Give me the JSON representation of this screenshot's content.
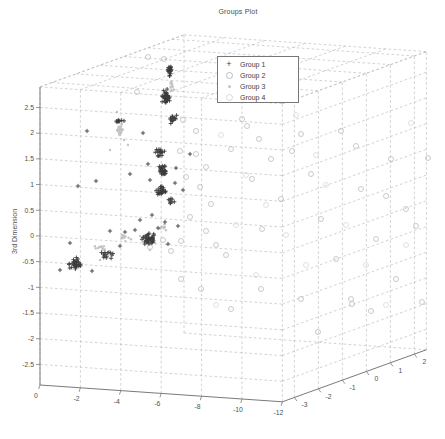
{
  "chart_data": {
    "type": "scatter",
    "projection": "3d",
    "title": "Groups Plot",
    "xlabel": "",
    "ylabel": "",
    "zlabel": "3rd Dimension",
    "x_ticks": [
      0,
      -2,
      -4,
      -6,
      -8,
      -10,
      -12
    ],
    "y_ticks": [
      -3,
      -2,
      -1,
      0,
      1,
      2
    ],
    "z_ticks": [
      2.5,
      2,
      1.5,
      1,
      0.5,
      0,
      -0.5,
      -1,
      -1.5,
      -2,
      -2.5
    ],
    "x_range": [
      -12,
      0
    ],
    "y_range": [
      -3.5,
      2.5
    ],
    "z_range": [
      -2.9,
      2.9
    ],
    "grid": true,
    "legend_position": "top-center",
    "colors": {
      "grid": "#b3b3b3",
      "axis": "#7a7a7a",
      "tick_label": "#4f4f4f",
      "title": "#4a4a4a",
      "legend_border": "#777777",
      "background": "#ffffff"
    },
    "groups": [
      {
        "name": "Group 1",
        "marker": "plus",
        "color": "#3c3c3c",
        "px_clusters": [
          {
            "cx": 170,
            "cy": 70,
            "rx": 4,
            "ry": 7,
            "n": 22
          },
          {
            "cx": 166,
            "cy": 97,
            "rx": 6,
            "ry": 9,
            "n": 40
          },
          {
            "cx": 173,
            "cy": 118,
            "rx": 6,
            "ry": 7,
            "n": 14
          },
          {
            "cx": 119,
            "cy": 121,
            "rx": 7,
            "ry": 2,
            "n": 10
          },
          {
            "cx": 159,
            "cy": 153,
            "rx": 6,
            "ry": 7,
            "n": 18
          },
          {
            "cx": 163,
            "cy": 171,
            "rx": 6,
            "ry": 8,
            "n": 30
          },
          {
            "cx": 161,
            "cy": 191,
            "rx": 7,
            "ry": 7,
            "n": 26
          },
          {
            "cx": 170,
            "cy": 201,
            "rx": 6,
            "ry": 4,
            "n": 8
          },
          {
            "cx": 148,
            "cy": 239,
            "rx": 11,
            "ry": 8,
            "n": 40
          },
          {
            "cx": 76,
            "cy": 263,
            "rx": 8,
            "ry": 8,
            "n": 32
          },
          {
            "cx": 108,
            "cy": 254,
            "rx": 11,
            "ry": 7,
            "n": 14
          }
        ],
        "px_points": [
          [
            96,
            181
          ],
          [
            78,
            186
          ],
          [
            130,
            174
          ],
          [
            87,
            131
          ],
          [
            143,
            133
          ],
          [
            190,
            154
          ],
          [
            152,
            215
          ],
          [
            140,
            220
          ],
          [
            178,
            226
          ],
          [
            70,
            243
          ],
          [
            60,
            270
          ],
          [
            92,
            271
          ],
          [
            120,
            246
          ],
          [
            135,
            230
          ],
          [
            165,
            222
          ],
          [
            176,
            168
          ],
          [
            150,
            180
          ],
          [
            148,
            164
          ],
          [
            175,
            183
          ],
          [
            183,
            190
          ],
          [
            125,
            232
          ],
          [
            110,
            231
          ],
          [
            158,
            228
          ],
          [
            168,
            244
          ]
        ]
      },
      {
        "name": "Group 2",
        "marker": "circle",
        "color": "#bdbdbd",
        "px_clusters": [],
        "px_points": [
          [
            148,
            57
          ],
          [
            164,
            59
          ],
          [
            137,
            92
          ],
          [
            183,
            120
          ],
          [
            196,
            131
          ],
          [
            247,
            126
          ],
          [
            259,
            139
          ],
          [
            292,
            151
          ],
          [
            180,
            151
          ],
          [
            196,
            154
          ],
          [
            206,
            167
          ],
          [
            186,
            177
          ],
          [
            200,
            187
          ],
          [
            211,
            204
          ],
          [
            190,
            217
          ],
          [
            206,
            231
          ],
          [
            216,
            245
          ],
          [
            226,
            255
          ],
          [
            181,
            241
          ],
          [
            171,
            251
          ],
          [
            231,
            149
          ],
          [
            242,
            119
          ],
          [
            252,
            179
          ],
          [
            262,
            229
          ],
          [
            271,
            159
          ],
          [
            281,
            199
          ],
          [
            301,
            134
          ],
          [
            311,
            174
          ],
          [
            321,
            219
          ],
          [
            336,
            259
          ],
          [
            351,
            299
          ],
          [
            361,
            189
          ],
          [
            376,
            239
          ],
          [
            391,
            159
          ],
          [
            406,
            209
          ],
          [
            301,
            299
          ],
          [
            261,
            289
          ],
          [
            231,
            309
          ],
          [
            201,
            289
          ],
          [
            181,
            279
          ],
          [
            341,
            131
          ],
          [
            371,
            311
          ],
          [
            396,
            279
          ],
          [
            416,
            226
          ],
          [
            356,
            146
          ],
          [
            386,
            196
          ],
          [
            163,
            240
          ],
          [
            150,
            247
          ],
          [
            318,
            332
          ],
          [
            352,
            304
          ],
          [
            428,
            158
          ],
          [
            422,
            302
          ]
        ]
      },
      {
        "name": "Group 3",
        "marker": "dot",
        "color": "#c4c4c4",
        "px_clusters": [
          {
            "cx": 120,
            "cy": 130,
            "rx": 5,
            "ry": 8,
            "n": 30
          },
          {
            "cx": 172,
            "cy": 85,
            "rx": 4,
            "ry": 10,
            "n": 12
          },
          {
            "cx": 126,
            "cy": 238,
            "rx": 8,
            "ry": 6,
            "n": 12
          },
          {
            "cx": 163,
            "cy": 227,
            "rx": 6,
            "ry": 5,
            "n": 10
          },
          {
            "cx": 100,
            "cy": 248,
            "rx": 10,
            "ry": 5,
            "n": 10
          }
        ],
        "px_points": [
          [
            110,
            150
          ],
          [
            128,
            145
          ],
          [
            140,
            236
          ],
          [
            150,
            250
          ],
          [
            100,
            260
          ],
          [
            117,
            112
          ],
          [
            124,
            140
          ],
          [
            155,
            243
          ]
        ]
      },
      {
        "name": "Group 4",
        "marker": "circle",
        "color": "#d8d8d8",
        "px_clusters": [],
        "px_points": [
          [
            221,
            135
          ],
          [
            246,
            175
          ],
          [
            266,
            205
          ],
          [
            286,
            235
          ],
          [
            306,
            265
          ],
          [
            326,
            185
          ],
          [
            346,
            225
          ],
          [
            366,
            265
          ],
          [
            386,
            305
          ],
          [
            406,
            245
          ],
          [
            296,
            115
          ],
          [
            316,
            155
          ],
          [
            256,
            275
          ],
          [
            236,
            225
          ],
          [
            216,
            305
          ],
          [
            411,
            123
          ]
        ]
      }
    ]
  }
}
